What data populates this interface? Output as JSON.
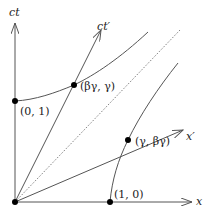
{
  "diagram": {
    "type": "spacetime-diagram",
    "axes": {
      "time_axis_label": "ct",
      "space_axis_label": "x",
      "boosted_time_axis_label": "ct′",
      "boosted_space_axis_label": "x′"
    },
    "points": [
      {
        "id": "p01",
        "label": "(0, 1)"
      },
      {
        "id": "p10",
        "label": "(1, 0)"
      },
      {
        "id": "pbg",
        "label": "(βγ, γ)"
      },
      {
        "id": "pgb",
        "label": "(γ, βγ)"
      }
    ],
    "curves": [
      {
        "id": "hyperbola-timelike",
        "description": "hyperbola through (0,1) and (βγ, γ)"
      },
      {
        "id": "hyperbola-spacelike",
        "description": "hyperbola through (1,0) and (γ, βγ)"
      },
      {
        "id": "light-cone",
        "description": "dotted 45° line"
      }
    ],
    "colors": {
      "line": "#555555",
      "dot": "#000000",
      "text": "#222222"
    }
  }
}
